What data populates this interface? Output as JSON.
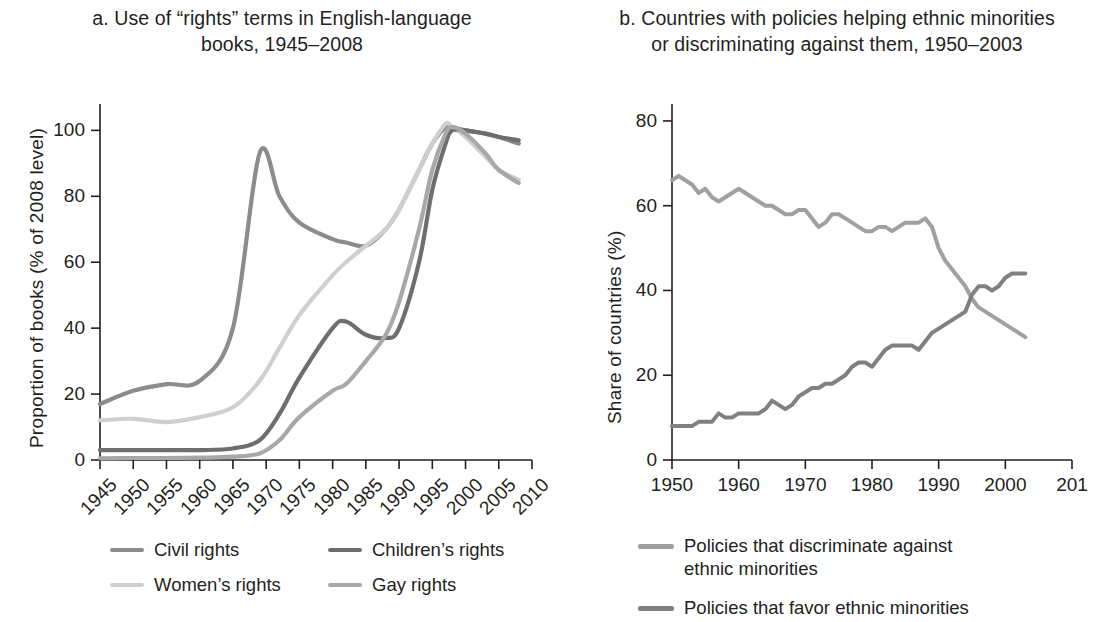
{
  "panel_a": {
    "title": "a. Use of “rights” terms in English-language\nbooks, 1945–2008",
    "ylabel": "Proportion of books (% of 2008 level)",
    "legend": [
      {
        "label": "Civil rights",
        "color": "#8c8c8c"
      },
      {
        "label": "Women’s rights",
        "color": "#cfcfcf"
      },
      {
        "label": "Children’s rights",
        "color": "#6e6e6e"
      },
      {
        "label": "Gay rights",
        "color": "#a8a8a8"
      }
    ]
  },
  "panel_b": {
    "title": "b. Countries with policies helping ethnic minorities\nor discriminating against them, 1950–2003",
    "ylabel": "Share of countries (%)",
    "legend": [
      {
        "label": "Policies that discriminate against\nethnic minorities",
        "color": "#a0a0a0"
      },
      {
        "label": "Policies that favor ethnic minorities",
        "color": "#808080"
      }
    ]
  },
  "chart_data": [
    {
      "type": "line",
      "panel": "a",
      "title": "a. Use of “rights” terms in English-language books, 1945–2008",
      "xlabel": "",
      "ylabel": "Proportion of books (% of 2008 level)",
      "xlim": [
        1945,
        2010
      ],
      "ylim": [
        0,
        108
      ],
      "yticks": [
        0,
        20,
        40,
        60,
        80,
        100
      ],
      "xticks": [
        1945,
        1950,
        1955,
        1960,
        1965,
        1970,
        1975,
        1980,
        1985,
        1990,
        1995,
        2000,
        2005,
        2010
      ],
      "grid": false,
      "legend_position": "below",
      "x": [
        1945,
        1950,
        1955,
        1960,
        1965,
        1969,
        1972,
        1975,
        1980,
        1982,
        1985,
        1988,
        1990,
        1993,
        1995,
        1997,
        1998,
        2000,
        2003,
        2005,
        2008
      ],
      "series": [
        {
          "name": "Civil rights",
          "color": "#8c8c8c",
          "values": [
            17,
            21,
            23,
            24,
            40,
            93,
            80,
            72,
            67,
            66,
            65,
            70,
            76,
            88,
            96,
            101,
            101,
            100,
            99,
            98,
            96
          ]
        },
        {
          "name": "Women’s rights",
          "color": "#cfcfcf",
          "values": [
            12,
            12.5,
            11.5,
            13,
            16,
            24,
            34,
            44,
            56,
            60,
            65,
            70,
            76,
            88,
            96,
            102,
            101,
            98,
            92,
            88,
            85
          ]
        },
        {
          "name": "Children’s rights",
          "color": "#6e6e6e",
          "values": [
            3,
            3,
            3,
            3,
            3.5,
            6,
            14,
            25,
            40,
            42,
            38,
            37,
            40,
            60,
            82,
            96,
            100,
            100,
            99,
            98,
            97
          ]
        },
        {
          "name": "Gay rights",
          "color": "#a8a8a8",
          "values": [
            0.5,
            0.6,
            0.6,
            0.7,
            1,
            2,
            6,
            13,
            21,
            23,
            30,
            38,
            48,
            70,
            88,
            99,
            101,
            99,
            93,
            88,
            84
          ]
        }
      ]
    },
    {
      "type": "line",
      "panel": "b",
      "title": "b. Countries with policies helping ethnic minorities or discriminating against them, 1950–2003",
      "xlabel": "",
      "ylabel": "Share of countries (%)",
      "xlim": [
        1950,
        2010
      ],
      "ylim": [
        0,
        84
      ],
      "yticks": [
        0,
        20,
        40,
        60,
        80
      ],
      "xticks": [
        1950,
        1960,
        1970,
        1980,
        1990,
        2000,
        2010
      ],
      "xtick_labels": [
        "1950",
        "1960",
        "1970",
        "1980",
        "1990",
        "2000",
        "201"
      ],
      "grid": false,
      "legend_position": "below",
      "x": [
        1950,
        1951,
        1952,
        1953,
        1954,
        1955,
        1956,
        1957,
        1958,
        1959,
        1960,
        1961,
        1962,
        1963,
        1964,
        1965,
        1966,
        1967,
        1968,
        1969,
        1970,
        1971,
        1972,
        1973,
        1974,
        1975,
        1976,
        1977,
        1978,
        1979,
        1980,
        1981,
        1982,
        1983,
        1984,
        1985,
        1986,
        1987,
        1988,
        1989,
        1990,
        1991,
        1992,
        1993,
        1994,
        1995,
        1996,
        1997,
        1998,
        1999,
        2000,
        2001,
        2002,
        2003
      ],
      "series": [
        {
          "name": "Policies that discriminate against ethnic minorities",
          "color": "#a0a0a0",
          "values": [
            66,
            67,
            66,
            65,
            63,
            64,
            62,
            61,
            62,
            63,
            64,
            63,
            62,
            61,
            60,
            60,
            59,
            58,
            58,
            59,
            59,
            57,
            55,
            56,
            58,
            58,
            57,
            56,
            55,
            54,
            54,
            55,
            55,
            54,
            55,
            56,
            56,
            56,
            57,
            55,
            50,
            47,
            45,
            43,
            41,
            38,
            36,
            35,
            34,
            33,
            32,
            31,
            30,
            29
          ]
        },
        {
          "name": "Policies that favor ethnic minorities",
          "color": "#808080",
          "values": [
            8,
            8,
            8,
            8,
            9,
            9,
            9,
            11,
            10,
            10,
            11,
            11,
            11,
            11,
            12,
            14,
            13,
            12,
            13,
            15,
            16,
            17,
            17,
            18,
            18,
            19,
            20,
            22,
            23,
            23,
            22,
            24,
            26,
            27,
            27,
            27,
            27,
            26,
            28,
            30,
            31,
            32,
            33,
            34,
            35,
            39,
            41,
            41,
            40,
            41,
            43,
            44,
            44,
            44
          ]
        }
      ]
    }
  ]
}
